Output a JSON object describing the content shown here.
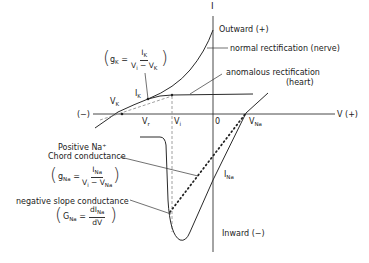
{
  "axes": {
    "y_axis_label": "I",
    "x_axis_label": "V (+)",
    "x_negative_label": "(−)",
    "origin_label": "0",
    "outward_label": "Outward (+)",
    "inward_label": "Inward (−)"
  },
  "points": {
    "vk": {
      "main": "V",
      "sub": "K"
    },
    "ik": {
      "main": "I",
      "sub": "K"
    },
    "vr": {
      "main": "V",
      "sub": "r"
    },
    "vi": {
      "main": "V",
      "sub": "i"
    },
    "vna": {
      "main": "V",
      "sub": "Na"
    },
    "ina": {
      "main": "I",
      "sub": "Na"
    }
  },
  "annotations": {
    "normal_rectification": "normal rectification (nerve)",
    "anomalous_rectification_line1": "anomalous rectification",
    "anomalous_rectification_line2": "(heart)",
    "positive_na_line1": "Positive Na⁺",
    "positive_na_line2": "Chord conductance",
    "negative_slope": "negative slope conductance"
  },
  "equations": {
    "gk": {
      "lhs_main": "g",
      "lhs_sub": "K",
      "eq": "=",
      "num_main": "I",
      "num_sub": "K",
      "den": "V",
      "den_sub1": "i",
      "den_mid": " − V",
      "den_sub2": "K"
    },
    "gna": {
      "lhs_main": "g",
      "lhs_sub": "Na",
      "eq": "=",
      "num_main": "I",
      "num_sub": "Na",
      "den": "V",
      "den_sub1": "i",
      "den_mid": " − V",
      "den_sub2": "Na"
    },
    "GNa": {
      "lhs_main": "G",
      "lhs_sub": "Na",
      "eq": "=",
      "num_main": "dI",
      "num_sub": "Na",
      "den": "dV"
    }
  },
  "colors": {
    "line": "#2a2a2a",
    "dashed": "#7a7a7a",
    "background": "#ffffff"
  }
}
